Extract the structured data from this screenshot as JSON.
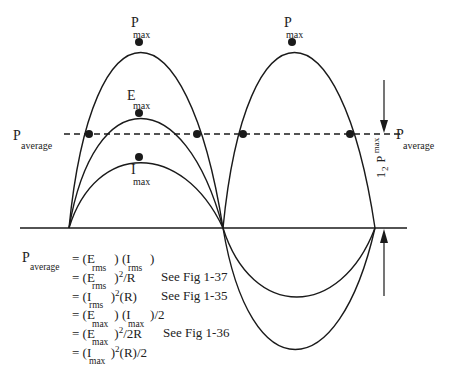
{
  "figure": {
    "labels": {
      "p_max_left": {
        "main": "P",
        "sub": "max"
      },
      "p_max_right": {
        "main": "P",
        "sub": "max"
      },
      "e_max": {
        "main": "E",
        "sub": "max"
      },
      "i_max": {
        "main": "I",
        "sub": "max"
      },
      "p_average_left": {
        "main": "P",
        "sub": "average"
      },
      "p_average_right": {
        "main": "P",
        "sub": "average"
      },
      "half_p_max": {
        "fraction_num": "1",
        "fraction_den": "2",
        "main": "P",
        "sub": "max"
      }
    },
    "curves": [
      "power (P)",
      "voltage (E)",
      "current (I)"
    ]
  },
  "equations": {
    "lhs": {
      "main": "P",
      "sub": "average"
    },
    "lines": [
      {
        "text": "= (E      ) (I      )",
        "subs": [
          "rms",
          "rms"
        ],
        "ref": ""
      },
      {
        "text": "= (E      )²/R",
        "subs": [
          "rms"
        ],
        "ref": "See Fig 1-37"
      },
      {
        "text": "= (I      )²(R)",
        "subs": [
          "rms"
        ],
        "ref": "See Fig 1-35"
      },
      {
        "text": "= (E      ) (I      )/2",
        "subs": [
          "max",
          "max"
        ],
        "ref": ""
      },
      {
        "text": "= (E      )²/2R",
        "subs": [
          "max"
        ],
        "ref": "See Fig 1-36"
      },
      {
        "text": "= (I      )²(R)/2",
        "subs": [
          "max"
        ],
        "ref": ""
      }
    ]
  }
}
